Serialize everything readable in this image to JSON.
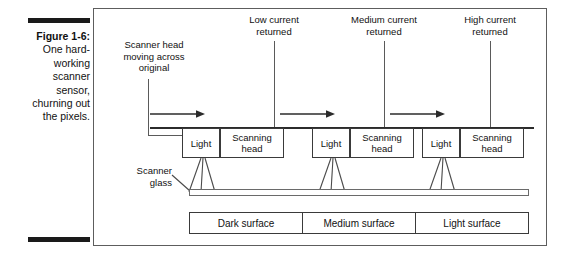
{
  "caption": {
    "figure_label": "Figure 1-6:",
    "lines": [
      "One hard-",
      "working",
      "scanner",
      "sensor,",
      "churning out",
      "the pixels."
    ]
  },
  "figure": {
    "annotations": {
      "scanner_head": "Scanner head\nmoving across\noriginal",
      "scanner_glass": "Scanner\nglass"
    },
    "current_labels": [
      {
        "text": "Low current\nreturned"
      },
      {
        "text": "Medium current\nreturned"
      },
      {
        "text": "High current\nreturned"
      }
    ],
    "sensor_groups": [
      {
        "light": "Light",
        "head": "Scanning\nhead"
      },
      {
        "light": "Light",
        "head": "Scanning\nhead"
      },
      {
        "light": "Light",
        "head": "Scanning\nhead"
      }
    ],
    "surfaces": [
      {
        "label": "Dark surface"
      },
      {
        "label": "Medium surface"
      },
      {
        "label": "Light surface"
      }
    ],
    "colors": {
      "ink": "#111111",
      "line": "#5a5a5a",
      "rail": "#2b2b2b",
      "frame": "#5d5d5d",
      "rule_bar": "#1a1a1a",
      "page": "#ffffff"
    }
  }
}
